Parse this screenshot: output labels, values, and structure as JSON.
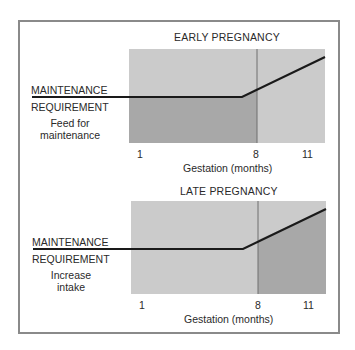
{
  "panels": [
    {
      "title": "EARLY PREGNANCY",
      "line_label_top": "MAINTENANCE",
      "line_label_bottom": "REQUIREMENT",
      "note_line1": "Feed for",
      "note_line2": "maintenance",
      "ticks": [
        "1",
        "8",
        "11"
      ],
      "xlabel": "Gestation (months)",
      "shaded_region": "below line, months 1-8"
    },
    {
      "title": "LATE PREGNANCY",
      "line_label_top": "MAINTENANCE",
      "line_label_bottom": "REQUIREMENT",
      "note_line1": "Increase",
      "note_line2": "intake",
      "ticks": [
        "1",
        "8",
        "11"
      ],
      "xlabel": "Gestation (months)",
      "shaded_region": "below line, months 8-11"
    }
  ],
  "colors": {
    "frame": "#8a8a8a",
    "light_fill": "#c9c9c9",
    "dark_fill": "#a9a9a9",
    "line": "#1a1a1a",
    "divider": "#6e6e6e"
  }
}
